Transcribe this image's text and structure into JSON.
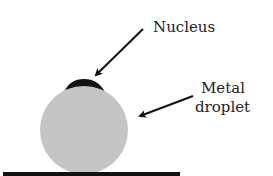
{
  "labels": {
    "nucleus": "Nucleus",
    "droplet_line1": "Metal",
    "droplet_line2": "droplet"
  },
  "colors": {
    "droplet_fill": "#c4c4c4",
    "nucleus_fill": "#111111",
    "arrow": "#111111",
    "substrate": "#111111"
  }
}
